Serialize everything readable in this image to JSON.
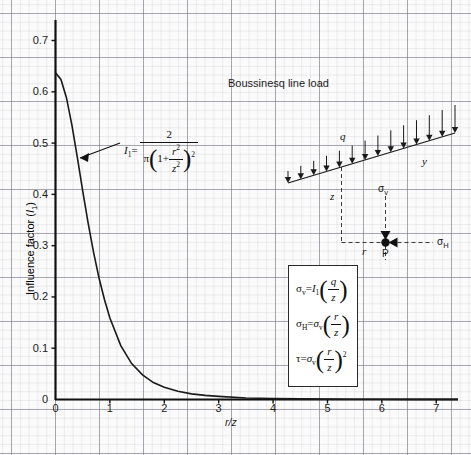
{
  "chart_data": {
    "type": "line",
    "title": "Boussinesq line load",
    "xlabel": "r / z",
    "ylabel": "Influence factor (I1)",
    "xlim": [
      0,
      7.4
    ],
    "ylim": [
      0,
      0.74
    ],
    "grid": true,
    "legend": "none",
    "xticks": [
      "0",
      "1",
      "2",
      "3",
      "4",
      "5",
      "6",
      "7"
    ],
    "xtick_values": [
      0,
      1,
      2,
      3,
      4,
      5,
      6,
      7
    ],
    "yticks": [
      "0",
      "0.1",
      "0.2",
      "0.3",
      "0.4",
      "0.5",
      "0.6",
      "0.7"
    ],
    "ytick_values": [
      0,
      0.1,
      0.2,
      0.3,
      0.4,
      0.5,
      0.6,
      0.7
    ],
    "series": [
      {
        "name": "I1 = 2 / (pi (1 + r^2/z^2)^2)",
        "x": [
          0,
          0.1,
          0.2,
          0.3,
          0.4,
          0.5,
          0.6,
          0.7,
          0.8,
          0.9,
          1.0,
          1.2,
          1.4,
          1.6,
          1.8,
          2.0,
          2.25,
          2.5,
          2.75,
          3.0,
          3.5,
          4.0,
          4.5,
          5.0,
          5.5,
          6.0,
          6.5,
          7.0,
          7.4
        ],
        "values": [
          0.637,
          0.624,
          0.589,
          0.536,
          0.473,
          0.407,
          0.344,
          0.287,
          0.237,
          0.195,
          0.159,
          0.105,
          0.07,
          0.048,
          0.033,
          0.024,
          0.016,
          0.011,
          0.008,
          0.006,
          0.003,
          0.002,
          0.0012,
          0.0008,
          0.0005,
          0.0004,
          0.0003,
          0.0002,
          0.0002
        ]
      }
    ],
    "annotations": [
      {
        "name": "influence-factor-formula",
        "text": "I1 = 2 / ( pi ( 1 + r^2 / z^2 )^2 )",
        "points_to": {
          "x": 0.38,
          "y": 0.45
        }
      }
    ]
  },
  "axis": {
    "y_label": "Influence factor (",
    "y_label_sym": "I",
    "y_label_sub": "1",
    "y_label_end": ")",
    "x_label_r": "r",
    "x_label_slash": "/",
    "x_label_z": "z"
  },
  "title": {
    "text": "Boussinesq line load"
  },
  "formula_callout": {
    "lhs_sym": "I",
    "lhs_sub": "1",
    "equals": "=",
    "numerator": "2",
    "den_pi": "π",
    "den_one_plus": "1+",
    "den_num": "r",
    "den_num_sup": "2",
    "den_den": "z",
    "den_den_sup": "2",
    "den_power": "2"
  },
  "equation_box": {
    "rows": [
      {
        "lhs_sym": "σ",
        "lhs_sub": "v",
        "eq": "=",
        "factor_sym": "I",
        "factor_sub": "1",
        "num": "q",
        "den": "z",
        "power": ""
      },
      {
        "lhs_sym": "σ",
        "lhs_sub": "H",
        "eq": "=",
        "factor_sym": "σ",
        "factor_sub": "v",
        "num": "r",
        "den": "z",
        "power": ""
      },
      {
        "lhs_sym": "τ",
        "lhs_sub": "",
        "eq": "=",
        "factor_sym": "σ",
        "factor_sub": "v",
        "num": "r",
        "den": "z",
        "power": "2"
      }
    ]
  },
  "diagram": {
    "load_label": "q",
    "y_axis_label": "y",
    "z_axis_label": "z",
    "r_label": "r",
    "point_label": "P",
    "sigma_v_sym": "σ",
    "sigma_v_sub": "v",
    "sigma_h_sym": "σ",
    "sigma_h_sub": "H",
    "arrow_count": 14
  }
}
